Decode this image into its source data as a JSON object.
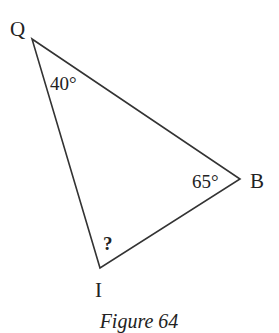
{
  "diagram": {
    "vertices": [
      {
        "name": "Q",
        "x": 32,
        "y": 39
      },
      {
        "name": "B",
        "x": 240,
        "y": 179
      },
      {
        "name": "I",
        "x": 100,
        "y": 268
      }
    ],
    "labels": {
      "Q": "Q",
      "B": "B",
      "I": "I",
      "angle_Q": "40°",
      "angle_B": "65°",
      "angle_I": "?"
    },
    "caption": "Figure 64",
    "stroke_color": "#333333"
  }
}
